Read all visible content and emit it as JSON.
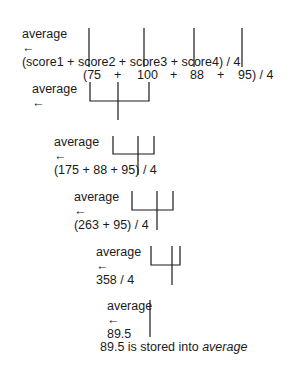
{
  "diagram": {
    "steps": [
      {
        "lhs": "average",
        "arrow": "←",
        "rhs": "(score1 + score2 + score3 + score4) / 4"
      },
      {
        "lhs": "average",
        "arrow": "←",
        "rhs_parts": [
          "(75",
          "+",
          "100",
          "+",
          "88",
          "+",
          "95) / 4"
        ]
      },
      {
        "lhs": "average",
        "arrow": "←",
        "rhs": "(175 + 88 + 95) / 4"
      },
      {
        "lhs": "average",
        "arrow": "←",
        "rhs": "(263 + 95) / 4"
      },
      {
        "lhs": "average",
        "arrow": "←",
        "rhs": "358 / 4"
      },
      {
        "lhs": "average",
        "arrow": "←",
        "rhs": "89.5"
      }
    ],
    "conclusion": {
      "prefix": "89.5 is stored into ",
      "variable": "average"
    }
  }
}
